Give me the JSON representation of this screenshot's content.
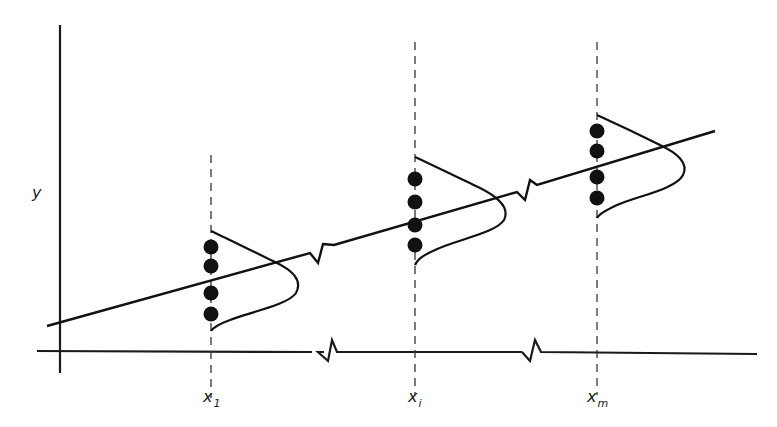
{
  "diagram": {
    "type": "regression-normality-assumption",
    "axes": {
      "y_label": "y",
      "x_ticks": [
        {
          "base": "x",
          "sub": "1"
        },
        {
          "base": "x",
          "sub": "i"
        },
        {
          "base": "x",
          "sub": "m"
        }
      ],
      "x_axis_breaks": 2,
      "regression_line_breaks": 2
    },
    "groups": [
      {
        "x_label": "x1",
        "points": 4,
        "distribution": "normal"
      },
      {
        "x_label": "xi",
        "points": 4,
        "distribution": "normal"
      },
      {
        "x_label": "xm",
        "points": 4,
        "distribution": "normal"
      }
    ],
    "colors": {
      "ink": "#111111",
      "background": "#ffffff"
    }
  }
}
